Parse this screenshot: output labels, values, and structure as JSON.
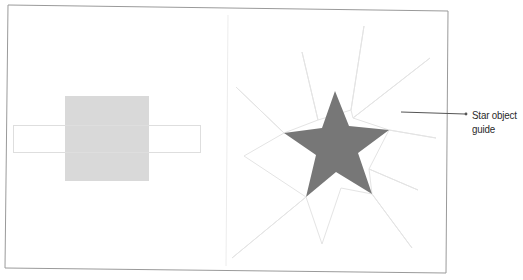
{
  "figure": {
    "type": "illustration-comparison",
    "panels": [
      {
        "id": "left",
        "description": "Square overlapping a thin horizontal rectangle outline",
        "shapes": [
          {
            "kind": "rect-outline",
            "role": "thin horizontal rectangle"
          },
          {
            "kind": "rect-filled",
            "role": "square",
            "fill": "#d9d9d9"
          }
        ]
      },
      {
        "id": "right",
        "description": "Five-point star with light multi-point star guide behind it",
        "shapes": [
          {
            "kind": "star-guide",
            "role": "star object guide",
            "stroke": "#e6e6e6"
          },
          {
            "kind": "star-filled",
            "role": "five-point star",
            "fill": "#777777"
          }
        ]
      }
    ],
    "callout": {
      "line1": "Star object",
      "line2": "guide",
      "line_color": "#555555"
    },
    "colors": {
      "frame": "#9a9a9a",
      "divider": "#ececec",
      "square_fill": "#d9d9d9",
      "rect_outline": "#dedede",
      "star_fill": "#777777",
      "guide_stroke": "#e4e4e4"
    }
  }
}
